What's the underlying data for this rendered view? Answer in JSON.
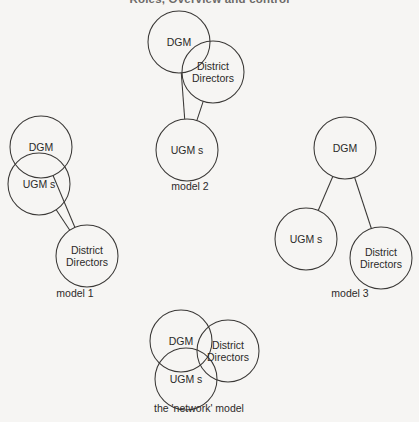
{
  "header": {
    "title": "Roles, Overview and control",
    "folio": ""
  },
  "figure": {
    "background_color": "#f6f5f3",
    "stroke_color": "#3a3836",
    "text_color": "#2c2a29",
    "models": [
      {
        "id": "model-1",
        "caption": "model 1",
        "caption_x": 75,
        "caption_y": 297,
        "nodes": [
          {
            "id": "dgm",
            "label": "DGM",
            "cx": 41,
            "cy": 147,
            "r": 31,
            "lines": [
              "DGM"
            ]
          },
          {
            "id": "ugms",
            "label": "UGM s",
            "cx": 39,
            "cy": 184,
            "r": 31,
            "lines": [
              "UGM s"
            ]
          },
          {
            "id": "directors",
            "label": "District Directors",
            "cx": 87,
            "cy": 256,
            "r": 31,
            "lines": [
              "District",
              "Directors"
            ]
          }
        ],
        "connectors": [
          {
            "from": "dgm",
            "to": "directors"
          },
          {
            "from": "ugms",
            "to": "directors"
          }
        ]
      },
      {
        "id": "model-2",
        "caption": "model 2",
        "caption_x": 190,
        "caption_y": 190,
        "nodes": [
          {
            "id": "dgm",
            "label": "DGM",
            "cx": 179,
            "cy": 42,
            "r": 31,
            "lines": [
              "DGM"
            ]
          },
          {
            "id": "directors",
            "label": "District Directors",
            "cx": 213,
            "cy": 72,
            "r": 31,
            "lines": [
              "District",
              "Directors"
            ]
          },
          {
            "id": "ugms",
            "label": "UGM s",
            "cx": 187,
            "cy": 150,
            "r": 31,
            "lines": [
              "UGM s"
            ]
          }
        ],
        "connectors": [
          {
            "from": "dgm",
            "to": "ugms"
          },
          {
            "from": "directors",
            "to": "ugms"
          }
        ]
      },
      {
        "id": "model-3",
        "caption": "model 3",
        "caption_x": 350,
        "caption_y": 297,
        "nodes": [
          {
            "id": "dgm",
            "label": "DGM",
            "cx": 345,
            "cy": 148,
            "r": 31,
            "lines": [
              "DGM"
            ]
          },
          {
            "id": "ugms",
            "label": "UGM s",
            "cx": 306,
            "cy": 239,
            "r": 31,
            "lines": [
              "UGM s"
            ]
          },
          {
            "id": "directors",
            "label": "District Directors",
            "cx": 381,
            "cy": 258,
            "r": 31,
            "lines": [
              "District",
              "Directors"
            ]
          }
        ],
        "connectors": [
          {
            "from": "dgm",
            "to": "ugms"
          },
          {
            "from": "dgm",
            "to": "directors"
          }
        ]
      },
      {
        "id": "network-model",
        "caption": "the 'network' model",
        "caption_x": 199,
        "caption_y": 412,
        "nodes": [
          {
            "id": "dgm",
            "label": "DGM",
            "cx": 181,
            "cy": 341,
            "r": 31,
            "lines": [
              "DGM"
            ]
          },
          {
            "id": "directors",
            "label": "District Directors",
            "cx": 228,
            "cy": 351,
            "r": 31,
            "lines": [
              "District",
              "Directors"
            ]
          },
          {
            "id": "ugms",
            "label": "UGM s",
            "cx": 186,
            "cy": 379,
            "r": 31,
            "lines": [
              "UGM s"
            ]
          }
        ],
        "connectors": []
      }
    ]
  }
}
